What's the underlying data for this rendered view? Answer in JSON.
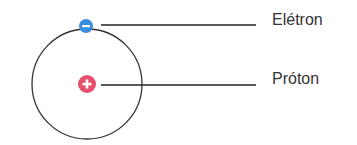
{
  "diagram": {
    "labels": {
      "electron": "Elétron",
      "proton": "Próton"
    },
    "colors": {
      "electron": "#3a8ee0",
      "proton": "#e5506a",
      "orbit": "#333333",
      "leader_line": "#222222",
      "text": "#333333"
    },
    "icons": {
      "electron": "minus-sign",
      "proton": "plus-sign"
    }
  }
}
